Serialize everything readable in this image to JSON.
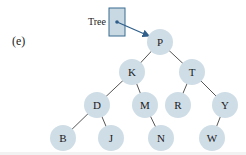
{
  "panel_label": "(e)",
  "root_pointer": {
    "label": "Tree",
    "box": {
      "x": 109,
      "y": 8,
      "w": 16,
      "h": 28,
      "fill": "#c9d9e3",
      "stroke": "#3a6a90"
    },
    "dot": {
      "x": 117,
      "y": 22
    },
    "arrow_to": {
      "x": 149,
      "y": 36
    },
    "arrow_color": "#2f5f8a"
  },
  "colors": {
    "node_fill": "#cfdde6",
    "edge": "#555555",
    "text": "#1a1a1a"
  },
  "node_radius": 13,
  "nodes": [
    {
      "id": "P",
      "label": "P",
      "x": 160,
      "y": 42
    },
    {
      "id": "K",
      "label": "K",
      "x": 132,
      "y": 72
    },
    {
      "id": "T",
      "label": "T",
      "x": 192,
      "y": 72
    },
    {
      "id": "D",
      "label": "D",
      "x": 97,
      "y": 105
    },
    {
      "id": "M",
      "label": "M",
      "x": 145,
      "y": 105
    },
    {
      "id": "R",
      "label": "R",
      "x": 178,
      "y": 105
    },
    {
      "id": "Y",
      "label": "Y",
      "x": 225,
      "y": 105
    },
    {
      "id": "B",
      "label": "B",
      "x": 63,
      "y": 138
    },
    {
      "id": "J",
      "label": "J",
      "x": 111,
      "y": 138
    },
    {
      "id": "N",
      "label": "N",
      "x": 161,
      "y": 138
    },
    {
      "id": "W",
      "label": "W",
      "x": 212,
      "y": 138
    }
  ],
  "edges": [
    [
      "P",
      "K"
    ],
    [
      "P",
      "T"
    ],
    [
      "K",
      "D"
    ],
    [
      "K",
      "M"
    ],
    [
      "T",
      "R"
    ],
    [
      "T",
      "Y"
    ],
    [
      "D",
      "B"
    ],
    [
      "D",
      "J"
    ],
    [
      "M",
      "N"
    ],
    [
      "Y",
      "W"
    ]
  ]
}
